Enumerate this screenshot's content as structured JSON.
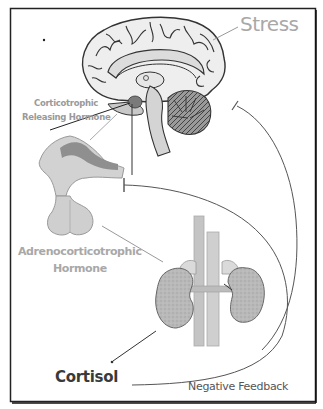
{
  "diagram": {
    "labels": {
      "stress": "Stress",
      "crh_line1": "Corticotrophic",
      "crh_line2": "Releasing Hormone",
      "acth_line1": "Adrenocorticotrophic",
      "acth_line2": "Hormone",
      "cortisol": "Cortisol",
      "negative_feedback": "Negative Feedback"
    },
    "structures": [
      "brain (sagittal section, hypothalamus)",
      "pituitary gland",
      "adrenal glands on kidneys"
    ],
    "arrows": [
      {
        "from": "Stress",
        "to": "brain",
        "type": "stimulate"
      },
      {
        "from": "hypothalamus",
        "to": "Corticotrophic Releasing Hormone",
        "type": "release"
      },
      {
        "from": "pituitary",
        "to": "adrenal glands",
        "type": "release ACTH"
      },
      {
        "from": "adrenal glands",
        "to": "Cortisol",
        "type": "release"
      },
      {
        "from": "Cortisol",
        "to": "pituitary",
        "type": "inhibit (negative feedback)"
      },
      {
        "from": "Cortisol",
        "to": "brain",
        "type": "inhibit (negative feedback)"
      }
    ],
    "colors": {
      "frame": "#222222",
      "label_gray": "#a8a8a8",
      "label_dark": "#3a3a3a",
      "line": "#555555",
      "tissue": "#c8c8c8",
      "tissue_dark": "#8a8a8a"
    }
  }
}
